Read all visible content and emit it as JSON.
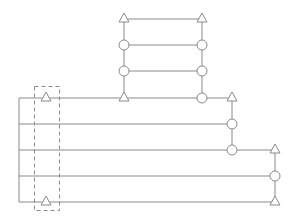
{
  "diagram": {
    "type": "wiring-ladder-schematic",
    "stroke_color": "#8a8a8a",
    "background": "#ffffff",
    "lines": [
      {
        "name": "main-left-rail",
        "x1": 19,
        "y1": 98,
        "x2": 19,
        "y2": 202
      },
      {
        "name": "row-1",
        "x1": 19,
        "y1": 98,
        "x2": 232,
        "y2": 98
      },
      {
        "name": "row-2",
        "x1": 19,
        "y1": 124,
        "x2": 232,
        "y2": 124
      },
      {
        "name": "row-3",
        "x1": 19,
        "y1": 150,
        "x2": 275,
        "y2": 150
      },
      {
        "name": "row-4",
        "x1": 19,
        "y1": 176,
        "x2": 275,
        "y2": 176
      },
      {
        "name": "row-5",
        "x1": 19,
        "y1": 202,
        "x2": 275,
        "y2": 202
      },
      {
        "name": "ladder-left-col",
        "x1": 124,
        "y1": 19,
        "x2": 124,
        "y2": 98
      },
      {
        "name": "ladder-right-col",
        "x1": 202,
        "y1": 19,
        "x2": 202,
        "y2": 98
      },
      {
        "name": "ladder-rung-1",
        "x1": 124,
        "y1": 19,
        "x2": 202,
        "y2": 19
      },
      {
        "name": "ladder-rung-2",
        "x1": 124,
        "y1": 45,
        "x2": 202,
        "y2": 45
      },
      {
        "name": "ladder-rung-3",
        "x1": 124,
        "y1": 71,
        "x2": 202,
        "y2": 71
      },
      {
        "name": "col-mid-right",
        "x1": 232,
        "y1": 98,
        "x2": 232,
        "y2": 150
      },
      {
        "name": "col-far-right",
        "x1": 275,
        "y1": 150,
        "x2": 275,
        "y2": 202
      }
    ],
    "triangles": [
      {
        "name": "triangle-ladder-top-left",
        "x": 124,
        "y": 19
      },
      {
        "name": "triangle-ladder-top-right",
        "x": 202,
        "y": 19
      },
      {
        "name": "triangle-ladder-bottom-left",
        "x": 124,
        "y": 98
      },
      {
        "name": "triangle-dashed-top",
        "x": 46,
        "y": 98
      },
      {
        "name": "triangle-dashed-bottom",
        "x": 46,
        "y": 202
      },
      {
        "name": "triangle-mid-right-top",
        "x": 232,
        "y": 98
      },
      {
        "name": "triangle-far-right-top",
        "x": 275,
        "y": 150
      },
      {
        "name": "triangle-far-right-bottom",
        "x": 275,
        "y": 202
      }
    ],
    "circles": [
      {
        "name": "circle-ladder-left-1",
        "x": 124,
        "y": 45
      },
      {
        "name": "circle-ladder-left-2",
        "x": 124,
        "y": 71
      },
      {
        "name": "circle-ladder-right-1",
        "x": 202,
        "y": 45
      },
      {
        "name": "circle-ladder-right-2",
        "x": 202,
        "y": 71
      },
      {
        "name": "circle-ladder-right-3",
        "x": 202,
        "y": 98
      },
      {
        "name": "circle-mid-right-1",
        "x": 232,
        "y": 124
      },
      {
        "name": "circle-mid-right-2",
        "x": 232,
        "y": 150
      },
      {
        "name": "circle-far-right-1",
        "x": 275,
        "y": 176
      }
    ],
    "dashed_box": {
      "name": "dashed-selection-box",
      "x": 34,
      "y": 86,
      "width": 25,
      "height": 124
    }
  }
}
